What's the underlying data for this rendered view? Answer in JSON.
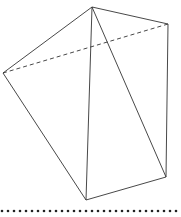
{
  "diagram": {
    "vertices": {
      "A": [
        92,
        7
      ],
      "B": [
        168,
        24
      ],
      "C": [
        3,
        73
      ],
      "D": [
        86,
        200
      ],
      "E": [
        166,
        177
      ]
    },
    "solid_edges": [
      [
        "A",
        "C"
      ],
      [
        "A",
        "B"
      ],
      [
        "A",
        "D"
      ],
      [
        "A",
        "E"
      ],
      [
        "B",
        "E"
      ],
      [
        "C",
        "D"
      ],
      [
        "D",
        "E"
      ]
    ],
    "dashed_edges": [
      [
        "C",
        "B"
      ]
    ],
    "line_color": "#333333",
    "dotted_line": {
      "y": 211,
      "x_start": 2,
      "x_end": 180,
      "spacing": 6,
      "color": "#222222"
    }
  }
}
